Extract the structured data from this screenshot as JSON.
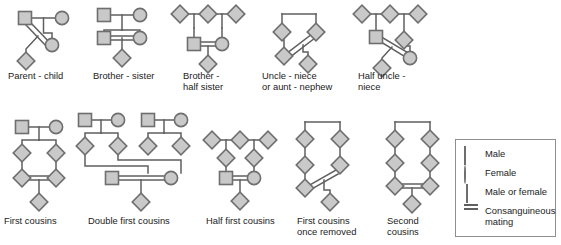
{
  "figure": {
    "title": "",
    "row1": [
      {
        "id": "parent-child",
        "label": "Parent - child",
        "label_x": 8,
        "label_y": 70
      },
      {
        "id": "brother-sister",
        "label": "Brother - sister",
        "label_x": 93,
        "label_y": 70
      },
      {
        "id": "brother-half-sister",
        "label": "Brother -\nhalf sister",
        "label_x": 183,
        "label_y": 70
      },
      {
        "id": "uncle-niece",
        "label": "Uncle - niece\nor aunt - nephew",
        "label_x": 262,
        "label_y": 70
      },
      {
        "id": "half-uncle-niece",
        "label": "Half uncle -\nniece",
        "label_x": 358,
        "label_y": 70
      }
    ],
    "row2": [
      {
        "id": "first-cousins",
        "label": "First cousins",
        "label_x": 4,
        "label_y": 215
      },
      {
        "id": "double-first-cousins",
        "label": "Double first cousins",
        "label_x": 88,
        "label_y": 215
      },
      {
        "id": "half-first-cousins",
        "label": "Half first cousins",
        "label_x": 206,
        "label_y": 215
      },
      {
        "id": "first-cousins-once-removed",
        "label": "First cousins\nonce removed",
        "label_x": 297,
        "label_y": 215
      },
      {
        "id": "second-cousins",
        "label": "Second\ncousins",
        "label_x": 387,
        "label_y": 215
      }
    ],
    "legend": {
      "items": [
        {
          "symbol": "square-symbol",
          "text": "Male"
        },
        {
          "symbol": "circle-symbol",
          "text": "Female"
        },
        {
          "symbol": "diamond-symbol",
          "text": "Male or female"
        },
        {
          "symbol": "double-line-symbol",
          "text": "Consanguineous\nmating"
        }
      ]
    },
    "colors": {
      "symbol_fill": "#c9c9c9",
      "symbol_stroke": "#6e6e6e",
      "line": "#5f5f5f",
      "text": "#222222",
      "legend_border": "#8e8e8e",
      "background": "#ffffff"
    }
  }
}
